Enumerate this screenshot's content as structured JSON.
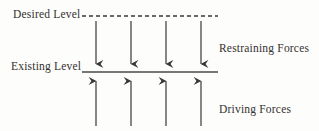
{
  "diagram": {
    "type": "force-field-analysis",
    "background_color": "#fdfdfc",
    "ink_color": "#33312f",
    "labels": {
      "desired_level": "Desired Level",
      "existing_level": "Existing Level",
      "restraining_forces": "Restraining Forces",
      "driving_forces": "Driving Forces"
    },
    "lines": [
      {
        "name": "desired-level-line",
        "style": "dashed",
        "x1": 82,
        "x2": 218,
        "y": 16,
        "dash_pattern": "4 3"
      },
      {
        "name": "existing-level-line",
        "style": "solid",
        "x1": 82,
        "x2": 218,
        "y": 72
      }
    ],
    "restraining_arrows": {
      "direction": "down",
      "count": 4,
      "x_positions": [
        96,
        131,
        166,
        201
      ],
      "y_start": 21,
      "y_end": 71
    },
    "driving_arrows": {
      "direction": "up",
      "count": 4,
      "x_positions": [
        96,
        131,
        166,
        201
      ],
      "y_start": 126,
      "y_end": 74
    }
  }
}
